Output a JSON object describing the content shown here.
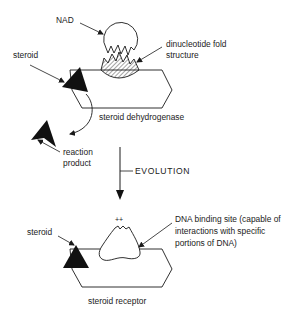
{
  "diagram": {
    "top_section": {
      "labels": {
        "nad": "NAD",
        "dinucleotide_line1": "dinucleotide fold",
        "dinucleotide_line2": "structure",
        "steroid": "steroid",
        "enzyme": "steroid dehydrogenase",
        "reaction_line1": "reaction",
        "reaction_line2": "product"
      }
    },
    "transition": {
      "label": "EVOLUTION"
    },
    "bottom_section": {
      "labels": {
        "charge": "++",
        "dna_line1": "DNA binding site (capable of",
        "dna_line2": "interactions with specific",
        "dna_line3": "portions of DNA)",
        "steroid": "steroid",
        "receptor": "steroid receptor"
      }
    },
    "colors": {
      "stroke": "#1a1a1a",
      "fill_dark": "#111111",
      "background": "#ffffff"
    }
  }
}
